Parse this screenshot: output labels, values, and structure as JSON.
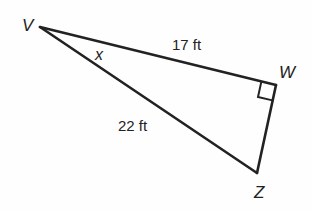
{
  "diagram": {
    "type": "right-triangle",
    "colors": {
      "stroke": "#222222",
      "background": "#fefefe"
    },
    "vertices": {
      "V": {
        "label": "V",
        "x": 40,
        "y": 27
      },
      "W": {
        "label": "W",
        "x": 276,
        "y": 85
      },
      "Z": {
        "label": "Z",
        "x": 257,
        "y": 173
      }
    },
    "sides": {
      "VW": {
        "label": "17 ft"
      },
      "VZ": {
        "label": "22 ft"
      },
      "WZ": {
        "label": ""
      }
    },
    "angle": {
      "at": "V",
      "label": "x"
    },
    "right_angle": {
      "at": "W"
    }
  }
}
